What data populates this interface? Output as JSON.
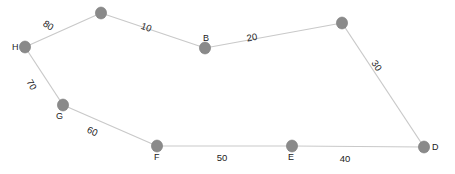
{
  "diagram": {
    "type": "weighted-graph",
    "colors": {
      "node": "#8a8a8a",
      "edge": "#c9c9c9",
      "text": "#222222",
      "background": "#ffffff"
    },
    "nodes": [
      {
        "id": "H",
        "label": "H",
        "x": 25,
        "y": 47,
        "label_x": 12,
        "label_y": 50
      },
      {
        "id": "top1",
        "label": "",
        "x": 101,
        "y": 13,
        "label_x": 101,
        "label_y": 13
      },
      {
        "id": "B",
        "label": "B",
        "x": 205,
        "y": 48,
        "label_x": 203,
        "label_y": 41
      },
      {
        "id": "top2",
        "label": "",
        "x": 342,
        "y": 23,
        "label_x": 342,
        "label_y": 23
      },
      {
        "id": "D",
        "label": "D",
        "x": 424,
        "y": 147,
        "label_x": 432,
        "label_y": 150
      },
      {
        "id": "E",
        "label": "E",
        "x": 292,
        "y": 146,
        "label_x": 288,
        "label_y": 160
      },
      {
        "id": "F",
        "label": "F",
        "x": 157,
        "y": 146,
        "label_x": 154,
        "label_y": 160
      },
      {
        "id": "G",
        "label": "G",
        "x": 63,
        "y": 105,
        "label_x": 56,
        "label_y": 119
      }
    ],
    "edges": [
      {
        "from": "H",
        "to": "top1",
        "weight": "80",
        "label_x": 48,
        "label_y": 26,
        "rotate": 33
      },
      {
        "from": "top1",
        "to": "B",
        "weight": "10",
        "label_x": 146,
        "label_y": 28,
        "rotate": 20
      },
      {
        "from": "B",
        "to": "top2",
        "weight": "20",
        "label_x": 252,
        "label_y": 38,
        "rotate": -10
      },
      {
        "from": "top2",
        "to": "D",
        "weight": "30",
        "label_x": 376,
        "label_y": 66,
        "rotate": 55
      },
      {
        "from": "D",
        "to": "E",
        "weight": "40",
        "label_x": 345,
        "label_y": 159,
        "rotate": 0
      },
      {
        "from": "E",
        "to": "F",
        "weight": "50",
        "label_x": 222,
        "label_y": 158,
        "rotate": 0
      },
      {
        "from": "F",
        "to": "G",
        "weight": "60",
        "label_x": 92,
        "label_y": 132,
        "rotate": 25
      },
      {
        "from": "G",
        "to": "H",
        "weight": "70",
        "label_x": 31,
        "label_y": 85,
        "rotate": 60
      }
    ]
  }
}
